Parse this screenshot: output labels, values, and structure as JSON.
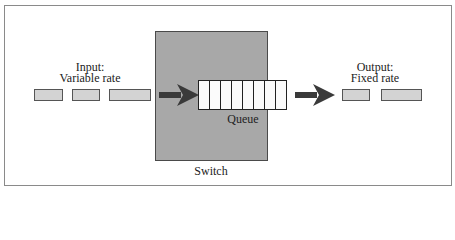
{
  "diagram": {
    "input_label": {
      "line1": "Input:",
      "line2": "Variable rate"
    },
    "output_label": {
      "line1": "Output:",
      "line2": "Fixed rate"
    },
    "queue_label": "Queue",
    "switch_label": "Switch",
    "queue_cells": 8,
    "input_packets": 3,
    "output_packets": 2,
    "colors": {
      "frame_border": "#8a8a8a",
      "switch_fill": "#a8a8a8",
      "packet_fill": "#d3d3d3",
      "packet_border": "#555555",
      "arrow": "#3a3a3a",
      "queue_fill": "#fafafa"
    }
  }
}
